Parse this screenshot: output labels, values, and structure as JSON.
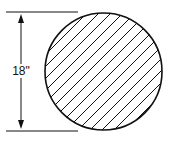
{
  "diagram": {
    "shape": "circle",
    "fill": "diagonal-hatch",
    "dimension": {
      "label": "18\"",
      "orientation": "vertical",
      "measures": "diameter"
    },
    "colors": {
      "stroke": "#111111",
      "background": "#ffffff"
    }
  }
}
